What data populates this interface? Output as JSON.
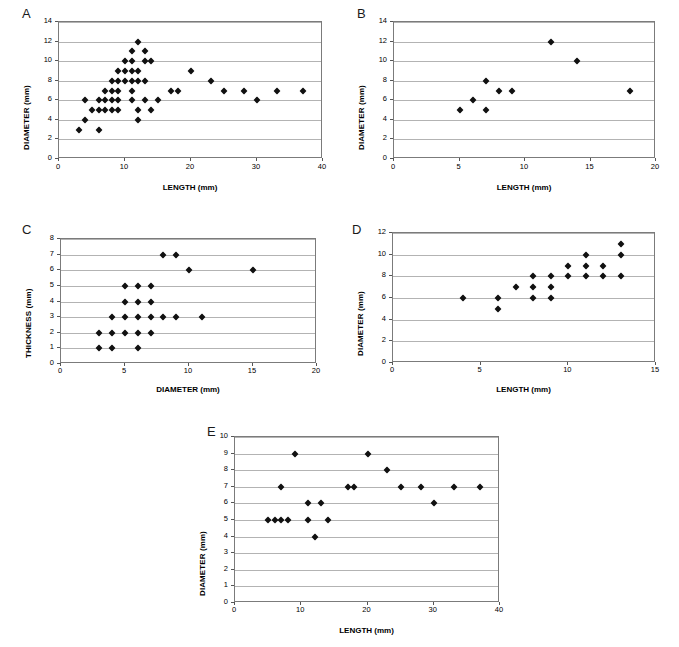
{
  "figure": {
    "background": "#ffffff",
    "marker_color": "#111111",
    "axis_color": "#7b7b7b",
    "grid_color": "#b3b3b3"
  },
  "panels": [
    {
      "letter": "A",
      "chart_data": {
        "type": "scatter",
        "title": "",
        "xlabel": "LENGTH (mm)",
        "ylabel": "DIAMETER (mm)",
        "xlim": [
          0,
          40
        ],
        "ylim": [
          0,
          14
        ],
        "xticks": [
          0,
          10,
          20,
          30,
          40
        ],
        "yticks": [
          0,
          2,
          4,
          6,
          8,
          10,
          12,
          14
        ],
        "grid": true,
        "legend": "none",
        "points": [
          [
            3,
            3
          ],
          [
            6,
            3
          ],
          [
            4,
            4
          ],
          [
            12,
            4
          ],
          [
            5,
            5
          ],
          [
            6,
            5
          ],
          [
            7,
            5
          ],
          [
            8,
            5
          ],
          [
            9,
            5
          ],
          [
            12,
            5
          ],
          [
            14,
            5
          ],
          [
            4,
            6
          ],
          [
            6,
            6
          ],
          [
            7,
            6
          ],
          [
            8,
            6
          ],
          [
            9,
            6
          ],
          [
            11,
            6
          ],
          [
            13,
            6
          ],
          [
            15,
            6
          ],
          [
            7,
            7
          ],
          [
            8,
            7
          ],
          [
            9,
            7
          ],
          [
            11,
            7
          ],
          [
            8,
            8
          ],
          [
            9,
            8
          ],
          [
            10,
            8
          ],
          [
            11,
            8
          ],
          [
            12,
            8
          ],
          [
            13,
            8
          ],
          [
            23,
            8
          ],
          [
            9,
            9
          ],
          [
            10,
            9
          ],
          [
            11,
            9
          ],
          [
            12,
            9
          ],
          [
            20,
            9
          ],
          [
            10,
            10
          ],
          [
            11,
            10
          ],
          [
            13,
            10
          ],
          [
            14,
            10
          ],
          [
            11,
            11
          ],
          [
            13,
            11
          ],
          [
            12,
            12
          ],
          [
            17,
            7
          ],
          [
            18,
            7
          ],
          [
            25,
            7
          ],
          [
            28,
            7
          ],
          [
            33,
            7
          ],
          [
            37,
            7
          ],
          [
            30,
            6
          ]
        ]
      }
    },
    {
      "letter": "B",
      "chart_data": {
        "type": "scatter",
        "title": "",
        "xlabel": "LENGTH (mm)",
        "ylabel": "DIAMETER (mm)",
        "xlim": [
          0,
          20
        ],
        "ylim": [
          0,
          14
        ],
        "xticks": [
          0,
          5,
          10,
          15,
          20
        ],
        "yticks": [
          0,
          2,
          4,
          6,
          8,
          10,
          12,
          14
        ],
        "grid": true,
        "legend": "none",
        "points": [
          [
            5,
            5
          ],
          [
            6,
            6
          ],
          [
            7,
            5
          ],
          [
            7,
            8
          ],
          [
            8,
            7
          ],
          [
            9,
            7
          ],
          [
            12,
            12
          ],
          [
            14,
            10
          ],
          [
            18,
            7
          ]
        ]
      }
    },
    {
      "letter": "C",
      "chart_data": {
        "type": "scatter",
        "title": "",
        "xlabel": "DIAMETER (mm)",
        "ylabel": "THICKNESS (mm)",
        "xlim": [
          0,
          20
        ],
        "ylim": [
          0,
          8
        ],
        "xticks": [
          0,
          5,
          10,
          15,
          20
        ],
        "yticks": [
          0,
          1,
          2,
          3,
          4,
          5,
          6,
          7,
          8
        ],
        "grid": true,
        "legend": "none",
        "points": [
          [
            3,
            1
          ],
          [
            4,
            1
          ],
          [
            6,
            1
          ],
          [
            3,
            2
          ],
          [
            4,
            2
          ],
          [
            5,
            2
          ],
          [
            6,
            2
          ],
          [
            7,
            2
          ],
          [
            4,
            3
          ],
          [
            5,
            3
          ],
          [
            6,
            3
          ],
          [
            7,
            3
          ],
          [
            8,
            3
          ],
          [
            9,
            3
          ],
          [
            11,
            3
          ],
          [
            5,
            4
          ],
          [
            6,
            4
          ],
          [
            7,
            4
          ],
          [
            5,
            5
          ],
          [
            6,
            5
          ],
          [
            7,
            5
          ],
          [
            10,
            6
          ],
          [
            15,
            6
          ],
          [
            8,
            7
          ],
          [
            9,
            7
          ]
        ]
      }
    },
    {
      "letter": "D",
      "chart_data": {
        "type": "scatter",
        "title": "",
        "xlabel": "LENGTH (mm)",
        "ylabel": "DIAMETER (mm)",
        "xlim": [
          0,
          15
        ],
        "ylim": [
          0,
          12
        ],
        "xticks": [
          0,
          5,
          10,
          15
        ],
        "yticks": [
          0,
          2,
          4,
          6,
          8,
          10,
          12
        ],
        "grid": true,
        "legend": "none",
        "points": [
          [
            4,
            6
          ],
          [
            6,
            5
          ],
          [
            6,
            6
          ],
          [
            7,
            7
          ],
          [
            8,
            6
          ],
          [
            8,
            7
          ],
          [
            8,
            8
          ],
          [
            9,
            6
          ],
          [
            9,
            7
          ],
          [
            9,
            8
          ],
          [
            10,
            8
          ],
          [
            10,
            9
          ],
          [
            11,
            8
          ],
          [
            11,
            9
          ],
          [
            11,
            10
          ],
          [
            12,
            8
          ],
          [
            12,
            9
          ],
          [
            13,
            8
          ],
          [
            13,
            10
          ],
          [
            13,
            11
          ]
        ]
      }
    },
    {
      "letter": "E",
      "chart_data": {
        "type": "scatter",
        "title": "",
        "xlabel": "LENGTH (mm)",
        "ylabel": "DIAMETER (mm)",
        "xlim": [
          0,
          40
        ],
        "ylim": [
          0,
          10
        ],
        "xticks": [
          0,
          10,
          20,
          30,
          40
        ],
        "yticks": [
          0,
          1,
          2,
          3,
          4,
          5,
          6,
          7,
          8,
          9,
          10
        ],
        "grid": true,
        "legend": "none",
        "points": [
          [
            5,
            5
          ],
          [
            6,
            5
          ],
          [
            7,
            5
          ],
          [
            8,
            5
          ],
          [
            7,
            7
          ],
          [
            9,
            9
          ],
          [
            11,
            5
          ],
          [
            11,
            6
          ],
          [
            12,
            4
          ],
          [
            13,
            6
          ],
          [
            14,
            5
          ],
          [
            17,
            7
          ],
          [
            18,
            7
          ],
          [
            20,
            9
          ],
          [
            23,
            8
          ],
          [
            25,
            7
          ],
          [
            28,
            7
          ],
          [
            30,
            6
          ],
          [
            33,
            7
          ],
          [
            37,
            7
          ]
        ]
      }
    }
  ]
}
